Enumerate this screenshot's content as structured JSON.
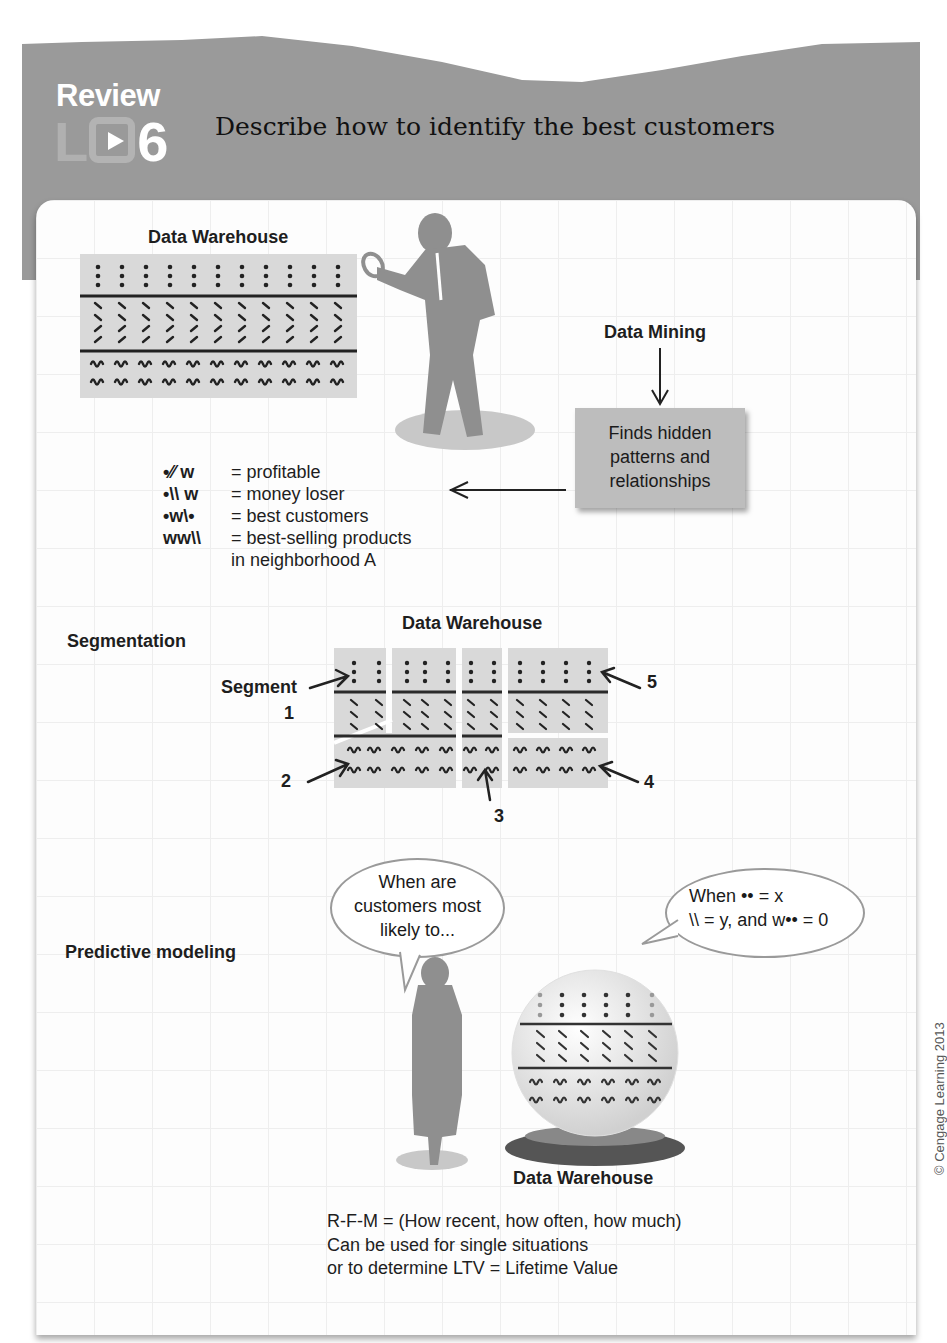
{
  "header": {
    "review_label": "Review",
    "lo_prefix": "L",
    "lo_number": "6",
    "title": "Describe how to identify the best customers"
  },
  "data_mining_section": {
    "warehouse_title": "Data Warehouse",
    "warehouse_rows": [
      ":  :  :  :  :  :  :  :  :  :  :",
      "\\  \\  \\  \\  \\  \\  \\  \\  \\  \\  \\",
      "ᴡ ᴡ ᴡ ᴡ ᴡ ᴡ ᴡ ᴡ ᴡ ᴡ ᴡ"
    ],
    "data_mining_label": "Data Mining",
    "box_text_lines": [
      "Finds hidden",
      "patterns and",
      "relationships"
    ],
    "legend": [
      {
        "symbol": "•⁄⁄ ᴡ",
        "meaning": "= profitable"
      },
      {
        "symbol": "•\\\\ ᴡ",
        "meaning": "= money loser"
      },
      {
        "symbol": "•ᴡ\\•",
        "meaning": "= best customers"
      },
      {
        "symbol": "ᴡᴡ\\\\",
        "meaning": "= best-selling products"
      },
      {
        "symbol": "",
        "meaning": "in neighborhood A"
      }
    ]
  },
  "segmentation_section": {
    "label": "Segmentation",
    "warehouse_title": "Data Warehouse",
    "segment_label": "Segment",
    "segment_numbers": [
      "1",
      "2",
      "3",
      "4",
      "5"
    ]
  },
  "predictive_section": {
    "label": "Predictive modeling",
    "question_bubble_lines": [
      "When are",
      "customers most",
      "likely to..."
    ],
    "answer_bubble_lines": [
      "When  •• = x",
      "\\\\ = y, and  ᴡ•• = 0"
    ],
    "warehouse_title": "Data Warehouse"
  },
  "footer": {
    "lines": [
      "R-F-M = (How recent, how often, how much)",
      "Can be used for single situations",
      "or to determine LTV = Lifetime Value"
    ],
    "copyright": "© Cengage Learning 2013"
  }
}
